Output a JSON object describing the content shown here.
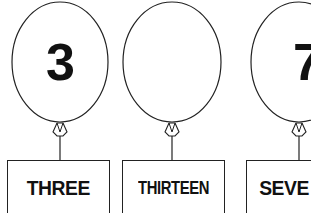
{
  "worksheet": {
    "balloons": [
      {
        "numeral": "3",
        "word": "THREE"
      },
      {
        "numeral": "",
        "word": "THIRTEEN"
      },
      {
        "numeral": "7",
        "word": "SEVE"
      }
    ]
  }
}
